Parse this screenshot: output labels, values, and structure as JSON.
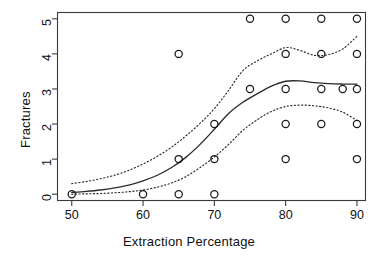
{
  "chart_data": {
    "type": "scatter",
    "title": "",
    "xlabel": "Extraction Percentage",
    "ylabel": "Fractures",
    "xlim": [
      48.0,
      91.2
    ],
    "ylim": [
      -0.18,
      5.18
    ],
    "xticks": [
      50,
      60,
      70,
      80,
      90
    ],
    "yticks": [
      0,
      1,
      2,
      3,
      4,
      5
    ],
    "xtick_labels": [
      "50",
      "60",
      "70",
      "80",
      "90"
    ],
    "ytick_labels": [
      "0",
      "1",
      "2",
      "3",
      "4",
      "5"
    ],
    "grid": false,
    "legend": "none",
    "marker": "open-circle",
    "points": [
      {
        "x": 50,
        "y": 0
      },
      {
        "x": 60,
        "y": 0
      },
      {
        "x": 65,
        "y": 0
      },
      {
        "x": 65,
        "y": 1
      },
      {
        "x": 65,
        "y": 4
      },
      {
        "x": 70,
        "y": 0
      },
      {
        "x": 70,
        "y": 1
      },
      {
        "x": 70,
        "y": 2
      },
      {
        "x": 75,
        "y": 3
      },
      {
        "x": 75,
        "y": 5
      },
      {
        "x": 80,
        "y": 1
      },
      {
        "x": 80,
        "y": 2
      },
      {
        "x": 80,
        "y": 3
      },
      {
        "x": 80,
        "y": 4
      },
      {
        "x": 80,
        "y": 5
      },
      {
        "x": 85,
        "y": 2
      },
      {
        "x": 85,
        "y": 3
      },
      {
        "x": 85,
        "y": 4
      },
      {
        "x": 85,
        "y": 5
      },
      {
        "x": 88,
        "y": 3
      },
      {
        "x": 90,
        "y": 1
      },
      {
        "x": 90,
        "y": 2
      },
      {
        "x": 90,
        "y": 3
      },
      {
        "x": 90,
        "y": 4
      },
      {
        "x": 90,
        "y": 5
      }
    ],
    "series": [
      {
        "name": "fit",
        "style": "solid",
        "x": [
          50,
          52,
          54,
          56,
          58,
          60,
          62,
          64,
          66,
          68,
          70,
          72,
          74,
          76,
          78,
          80,
          82,
          84,
          86,
          88,
          90
        ],
        "y": [
          0.05,
          0.08,
          0.12,
          0.18,
          0.26,
          0.38,
          0.54,
          0.76,
          1.05,
          1.42,
          1.85,
          2.3,
          2.62,
          2.86,
          3.08,
          3.22,
          3.23,
          3.18,
          3.15,
          3.14,
          3.14
        ]
      },
      {
        "name": "upper-confidence-band",
        "style": "dotted",
        "x": [
          50,
          52,
          54,
          56,
          58,
          60,
          62,
          64,
          66,
          68,
          70,
          72,
          74,
          76,
          78,
          80,
          82,
          84,
          86,
          88,
          90
        ],
        "y": [
          0.3,
          0.36,
          0.44,
          0.54,
          0.68,
          0.86,
          1.08,
          1.34,
          1.66,
          2.02,
          2.44,
          2.96,
          3.52,
          3.8,
          4.0,
          4.18,
          4.1,
          3.96,
          3.98,
          4.14,
          4.5
        ]
      },
      {
        "name": "lower-confidence-band",
        "style": "dotted",
        "x": [
          50,
          52,
          54,
          56,
          58,
          60,
          62,
          64,
          66,
          68,
          70,
          72,
          74,
          76,
          78,
          80,
          82,
          84,
          86,
          88,
          90
        ],
        "y": [
          0.0,
          0.01,
          0.02,
          0.04,
          0.07,
          0.12,
          0.2,
          0.32,
          0.5,
          0.76,
          1.06,
          1.42,
          1.82,
          2.12,
          2.36,
          2.5,
          2.54,
          2.52,
          2.46,
          2.34,
          2.1
        ]
      }
    ]
  }
}
